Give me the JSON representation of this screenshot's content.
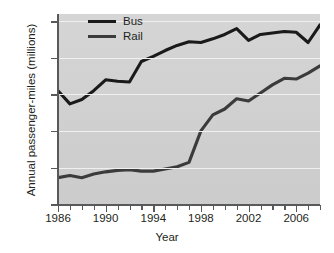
{
  "chart_data": {
    "type": "line",
    "title": "",
    "xlabel": "Year",
    "ylabel": "Annual passenger-miles (millions)",
    "xlim": [
      1986,
      2008
    ],
    "ylim": [
      0,
      260
    ],
    "yticks": [
      0,
      50,
      100,
      150,
      200,
      250
    ],
    "ytick_labels": [
      "0",
      "50",
      "100",
      "150",
      "200",
      "250"
    ],
    "xticks": [
      1986,
      1987,
      1988,
      1989,
      1990,
      1991,
      1992,
      1993,
      1994,
      1995,
      1996,
      1997,
      1998,
      1999,
      2000,
      2001,
      2002,
      2003,
      2004,
      2005,
      2006,
      2007,
      2008
    ],
    "xtick_labels_shown": [
      "1986",
      "1990",
      "1994",
      "1998",
      "2002",
      "2006"
    ],
    "xtick_label_years": [
      1986,
      1990,
      1994,
      1998,
      2002,
      2006
    ],
    "grid": "horizontal",
    "legend_position": "top-left-inside",
    "plot_background": "#d3d3d3",
    "gridline_color": "#f0f0f0",
    "x": [
      1986,
      1987,
      1988,
      1989,
      1990,
      1991,
      1992,
      1993,
      1994,
      1995,
      1996,
      1997,
      1998,
      1999,
      2000,
      2001,
      2002,
      2003,
      2004,
      2005,
      2006,
      2007,
      2008
    ],
    "series": [
      {
        "name": "Bus",
        "color": "#1a1a1a",
        "values": [
          155,
          137,
          143,
          155,
          170,
          168,
          167,
          195,
          202,
          210,
          217,
          222,
          221,
          226,
          232,
          240,
          224,
          232,
          234,
          236,
          235,
          221,
          245
        ]
      },
      {
        "name": "Rail",
        "color": "#3b3b3b",
        "values": [
          36,
          39,
          36,
          41,
          44,
          46,
          47,
          45,
          45,
          48,
          51,
          57,
          100,
          122,
          130,
          144,
          141,
          152,
          163,
          172,
          171,
          179,
          189
        ]
      }
    ]
  },
  "legend": {
    "items": [
      {
        "label": "Bus",
        "swatch": "line-swatch-bus"
      },
      {
        "label": "Rail",
        "swatch": "line-swatch-rail"
      }
    ]
  },
  "axes": {
    "y_title": "Annual passenger-miles (millions)",
    "x_title": "Year"
  },
  "footer": {
    "cut_off_text": ""
  }
}
